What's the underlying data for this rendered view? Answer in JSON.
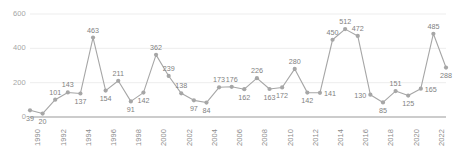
{
  "chart_data": {
    "type": "line",
    "title": "",
    "subtitle": "",
    "xlabel": "",
    "ylabel": "",
    "ylim": [
      0,
      600
    ],
    "grid": true,
    "legend": false,
    "legend_position": "none",
    "marker": "circle",
    "line_color": "#a6a6a6",
    "marker_color": "#a6a6a6",
    "gridline_color": "#e8e8e8",
    "axis_color": "#9a9a9a",
    "label_color": "#7f7f7f",
    "y_ticks": [
      "0",
      "200",
      "400",
      "600"
    ],
    "y_tick_values": [
      0,
      200,
      400,
      600
    ],
    "x_ticks": [
      "1990",
      "1992",
      "1994",
      "1996",
      "1998",
      "2000",
      "2002",
      "2004",
      "2006",
      "2008",
      "2010",
      "2012",
      "2014",
      "2016",
      "2018",
      "2020",
      "2022"
    ],
    "x": [
      1990,
      1991,
      1992,
      1993,
      1994,
      1995,
      1996,
      1997,
      1998,
      1999,
      2000,
      2001,
      2002,
      2003,
      2004,
      2005,
      2006,
      2007,
      2008,
      2009,
      2010,
      2011,
      2012,
      2013,
      2014,
      2015,
      2016,
      2017,
      2018,
      2019,
      2020,
      2021,
      2022,
      2023
    ],
    "categories": [
      "1990",
      "1991",
      "1992",
      "1993",
      "1994",
      "1995",
      "1996",
      "1997",
      "1998",
      "1999",
      "2000",
      "2001",
      "2002",
      "2003",
      "2004",
      "2005",
      "2006",
      "2007",
      "2008",
      "2009",
      "2010",
      "2011",
      "2012",
      "2013",
      "2014",
      "2015",
      "2016",
      "2017",
      "2018",
      "2019",
      "2020",
      "2021",
      "2022",
      "2023"
    ],
    "values": [
      39,
      20,
      101,
      143,
      137,
      463,
      154,
      211,
      91,
      142,
      362,
      239,
      138,
      97,
      84,
      173,
      176,
      162,
      226,
      163,
      172,
      280,
      142,
      141,
      450,
      512,
      472,
      130,
      85,
      151,
      125,
      165,
      485,
      288
    ],
    "data_labels": [
      "39",
      "20",
      "101",
      "143",
      "137",
      "463",
      "154",
      "211",
      "91",
      "142",
      "362",
      "239",
      "138",
      "97",
      "84",
      "173",
      "176",
      "162",
      "226",
      "163",
      "172",
      "280",
      "142",
      "141",
      "450",
      "512",
      "472",
      "130",
      "85",
      "151",
      "125",
      "165",
      "485",
      "288"
    ],
    "label_positions": [
      "below",
      "below",
      "above",
      "above",
      "below",
      "above",
      "below",
      "above",
      "below",
      "below",
      "above",
      "above",
      "above",
      "below",
      "below",
      "above",
      "above",
      "below",
      "above",
      "below",
      "below",
      "above",
      "below",
      "right",
      "above",
      "above",
      "above",
      "left",
      "below",
      "above",
      "below",
      "right",
      "above",
      "below"
    ]
  }
}
